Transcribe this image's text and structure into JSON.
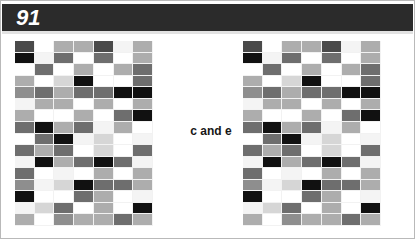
{
  "header": {
    "figure_number": "91",
    "bar_color": "#2b2b2b",
    "text_color": "#ffffff"
  },
  "caption": {
    "text": "c and e",
    "color": "#171717"
  },
  "page": {
    "background": "#ffffff",
    "frame_color": "#b9b9b9"
  },
  "chart_data": {
    "type": "heatmap",
    "title": "91",
    "subtitle": "c and e",
    "xlabel": "",
    "ylabel": "",
    "grid": false,
    "legend": "none",
    "rows": 16,
    "cols": 7,
    "palette": {
      "0": "#111111",
      "1": "#4a4a4a",
      "2": "#6e6e6e",
      "3": "#8e8e8e",
      "4": "#adadad",
      "5": "#d6d6d6",
      "6": "#f4f4f4",
      "7": "#ffffff"
    },
    "panels": [
      {
        "name": "left-matrix",
        "values": [
          [
            1,
            7,
            4,
            4,
            1,
            6,
            4
          ],
          [
            0,
            6,
            2,
            7,
            2,
            7,
            4
          ],
          [
            7,
            2,
            7,
            4,
            7,
            4,
            2
          ],
          [
            4,
            7,
            5,
            0,
            7,
            7,
            2
          ],
          [
            3,
            2,
            4,
            2,
            2,
            0,
            0
          ],
          [
            6,
            4,
            4,
            7,
            4,
            7,
            4
          ],
          [
            4,
            7,
            7,
            4,
            7,
            2,
            0
          ],
          [
            2,
            0,
            4,
            2,
            6,
            4,
            7
          ],
          [
            7,
            2,
            0,
            6,
            5,
            7,
            6
          ],
          [
            2,
            4,
            2,
            7,
            5,
            7,
            2
          ],
          [
            6,
            0,
            4,
            2,
            0,
            2,
            6
          ],
          [
            2,
            7,
            6,
            7,
            4,
            7,
            4
          ],
          [
            3,
            6,
            5,
            0,
            2,
            2,
            4
          ],
          [
            0,
            7,
            7,
            2,
            4,
            7,
            6
          ],
          [
            6,
            5,
            2,
            7,
            4,
            7,
            0
          ],
          [
            4,
            7,
            3,
            4,
            4,
            2,
            4
          ]
        ]
      },
      {
        "name": "right-matrix",
        "values": [
          [
            1,
            7,
            4,
            4,
            1,
            6,
            4
          ],
          [
            0,
            6,
            2,
            7,
            2,
            7,
            4
          ],
          [
            7,
            2,
            7,
            4,
            7,
            4,
            2
          ],
          [
            4,
            7,
            5,
            0,
            7,
            7,
            2
          ],
          [
            3,
            2,
            4,
            2,
            2,
            0,
            0
          ],
          [
            6,
            4,
            4,
            7,
            4,
            7,
            4
          ],
          [
            4,
            7,
            7,
            4,
            7,
            2,
            0
          ],
          [
            2,
            0,
            4,
            2,
            6,
            4,
            7
          ],
          [
            7,
            2,
            0,
            6,
            5,
            7,
            6
          ],
          [
            2,
            4,
            2,
            7,
            5,
            7,
            2
          ],
          [
            6,
            0,
            4,
            2,
            0,
            2,
            6
          ],
          [
            2,
            7,
            6,
            7,
            4,
            7,
            4
          ],
          [
            3,
            6,
            5,
            0,
            2,
            2,
            4
          ],
          [
            0,
            7,
            7,
            2,
            4,
            7,
            6
          ],
          [
            6,
            5,
            2,
            7,
            4,
            7,
            0
          ],
          [
            4,
            7,
            3,
            4,
            4,
            2,
            4
          ]
        ]
      }
    ]
  }
}
